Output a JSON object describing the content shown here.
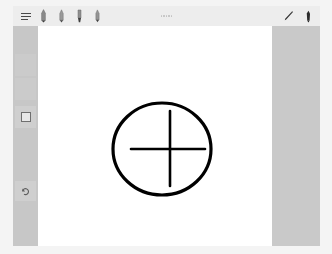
{
  "app": {
    "title": "Drawing Canvas",
    "background_color": "#f4f4f4",
    "window_chrome_color": "#c9c9c9",
    "canvas_color": "#ffffff"
  },
  "toolbar": {
    "background_color": "#ededed",
    "menu_button": {
      "name": "menu-icon",
      "label": "Menu"
    },
    "tools": [
      {
        "name": "pen-tool-icon",
        "label": "Pen",
        "selected": false
      },
      {
        "name": "marker-tool-icon",
        "label": "Marker",
        "selected": false
      },
      {
        "name": "highlighter-tool-icon",
        "label": "Highlighter",
        "selected": false
      },
      {
        "name": "brush-tool-icon",
        "label": "Brush",
        "selected": false
      }
    ],
    "center_indicator": {
      "name": "more-options-icon",
      "label": "..."
    },
    "right_tools": [
      {
        "name": "pencil-tool-icon",
        "label": "Pencil"
      },
      {
        "name": "ink-pen-tool-icon",
        "label": "Ink Pen"
      }
    ]
  },
  "sidebar": {
    "background_color": "#c7c7c7",
    "items": [
      {
        "name": "sidebar-slot-1",
        "label": "Tool Slot 1",
        "icon": "none",
        "top": 28,
        "height": 22
      },
      {
        "name": "sidebar-slot-2",
        "label": "Tool Slot 2",
        "icon": "none",
        "top": 52,
        "height": 22
      },
      {
        "name": "sidebar-slot-shape",
        "label": "Shape Tool",
        "icon": "square-icon",
        "top": 80,
        "height": 22
      },
      {
        "name": "sidebar-slot-undo",
        "label": "Undo Tool",
        "icon": "undo-icon",
        "top": 155,
        "height": 20
      }
    ]
  },
  "drawing": {
    "name": "circle-crosshair-sketch",
    "stroke_color": "#000000",
    "shapes": [
      {
        "type": "ellipse",
        "name": "circle-shape",
        "cx": 124,
        "cy": 123,
        "rx": 49,
        "ry": 46,
        "stroke_width": 3.2
      },
      {
        "type": "line",
        "name": "crosshair-horizontal-line",
        "x1": 93,
        "y1": 123,
        "x2": 167,
        "y2": 123,
        "stroke_width": 2.6
      },
      {
        "type": "line",
        "name": "crosshair-vertical-line",
        "x1": 132,
        "y1": 85,
        "x2": 132,
        "y2": 160,
        "stroke_width": 2.6
      }
    ]
  }
}
